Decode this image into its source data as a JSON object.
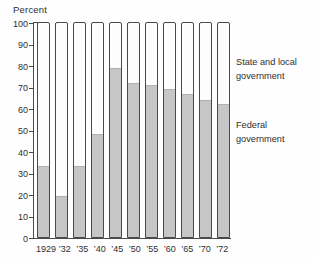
{
  "chart_data": {
    "type": "bar",
    "stacked": true,
    "title": "",
    "ylabel": "Percent",
    "xlabel": "",
    "ylim": [
      0,
      100
    ],
    "yticks": [
      0,
      10,
      20,
      30,
      40,
      50,
      60,
      70,
      80,
      90,
      100
    ],
    "categories": [
      "1929",
      "’32",
      "’35",
      "’40",
      "’45",
      "’50",
      "’55",
      "’60",
      "’65",
      "’70",
      "’72"
    ],
    "series": [
      {
        "name": "Federal government",
        "color": "#c6c6c6",
        "values": [
          33,
          19,
          33,
          48,
          79,
          72,
          71,
          69,
          67,
          64,
          62
        ]
      },
      {
        "name": "State and local government",
        "color": "#fdfdfd",
        "values": [
          67,
          81,
          67,
          52,
          21,
          28,
          29,
          31,
          33,
          36,
          38
        ]
      }
    ],
    "legend": {
      "position": "right",
      "state_local": "State and local government",
      "federal": "Federal government"
    },
    "grid": false,
    "colors": {
      "bar_fill": "#c6c6c6",
      "bar_outline": "#4a4a4a",
      "background": "#fefefe",
      "text": "#2e2e2e"
    }
  }
}
